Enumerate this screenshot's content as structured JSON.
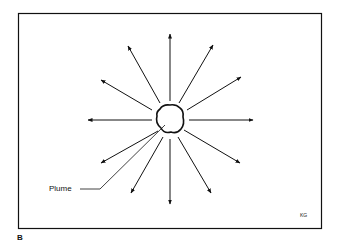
{
  "figure": {
    "panel_label": "B",
    "callout_label": "Plume",
    "signature": "KG",
    "arrow_count": 12
  }
}
